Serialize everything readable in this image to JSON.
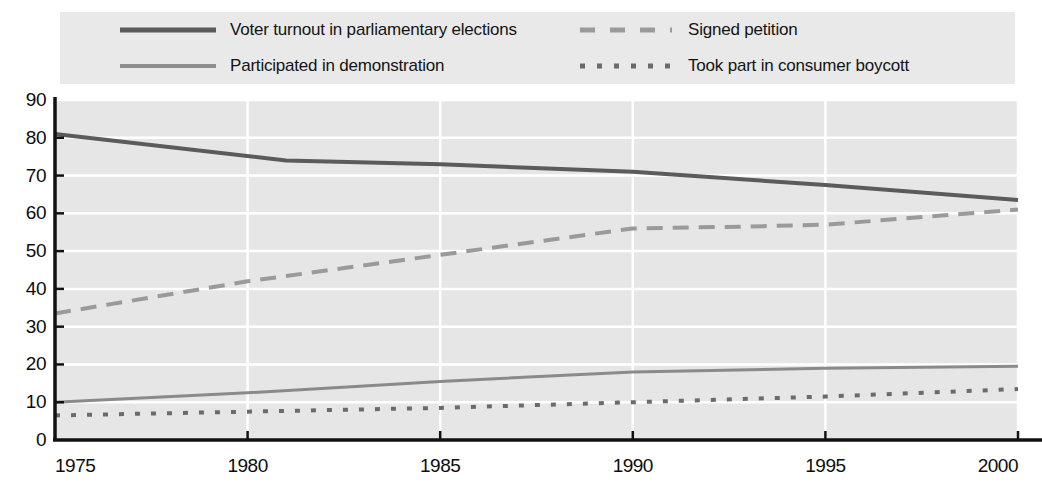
{
  "chart_data": {
    "type": "line",
    "title": "",
    "subtitle": "",
    "xlabel": "",
    "ylabel": "",
    "xlim": [
      1975,
      2000
    ],
    "ylim": [
      0,
      90
    ],
    "grid": true,
    "legend_position": "top",
    "x_ticks": [
      "1975",
      "1980",
      "1985",
      "1990",
      "1995",
      "2000"
    ],
    "x_tick_values": [
      1975,
      1980,
      1985,
      1990,
      1995,
      2000
    ],
    "y_ticks": [
      "0",
      "10",
      "20",
      "30",
      "40",
      "50",
      "60",
      "70",
      "80",
      "90"
    ],
    "y_tick_values": [
      0,
      10,
      20,
      30,
      40,
      50,
      60,
      70,
      80,
      90
    ],
    "series": [
      {
        "name": "Voter turnout in parliamentary elections",
        "style": "solid",
        "color": "#5b5b5b",
        "width": 4,
        "x": [
          1975,
          1981,
          1985,
          1990,
          1995,
          2000
        ],
        "values": [
          81,
          74,
          73,
          71,
          67.5,
          63.5
        ]
      },
      {
        "name": "Signed petition",
        "style": "dashed",
        "color": "#9a9a9a",
        "width": 4,
        "x": [
          1975,
          1980,
          1985,
          1990,
          1993,
          1995,
          2000
        ],
        "values": [
          33.5,
          42,
          49,
          56,
          56.5,
          57,
          61
        ]
      },
      {
        "name": "Participated in demonstration",
        "style": "solid",
        "color": "#8a8a8a",
        "width": 3,
        "x": [
          1975,
          1980,
          1985,
          1990,
          1995,
          2000
        ],
        "values": [
          10,
          12.5,
          15.5,
          18,
          19,
          19.5
        ]
      },
      {
        "name": "Took part in consumer boycott",
        "style": "dotted",
        "color": "#6b6b6b",
        "width": 4,
        "x": [
          1975,
          1980,
          1985,
          1990,
          1995,
          2000
        ],
        "values": [
          6.5,
          7.5,
          8.5,
          10,
          11.5,
          13.5
        ]
      }
    ]
  },
  "legend": {
    "entries": [
      {
        "label": "Voter turnout in parliamentary elections",
        "style": "solid",
        "color": "#5b5b5b",
        "width": 5
      },
      {
        "label": "Signed petition",
        "style": "dashed",
        "color": "#9a9a9a",
        "width": 5
      },
      {
        "label": "Participated in demonstration",
        "style": "solid",
        "color": "#8e8e8e",
        "width": 4
      },
      {
        "label": "Took part in consumer boycott",
        "style": "dotted",
        "color": "#6b6b6b",
        "width": 5
      }
    ]
  },
  "colors": {
    "plot_background": "#e6e6e6",
    "legend_background": "#e9e9e9",
    "gridline": "#ffffff",
    "axis": "#111111",
    "text": "#0d0d0d"
  }
}
